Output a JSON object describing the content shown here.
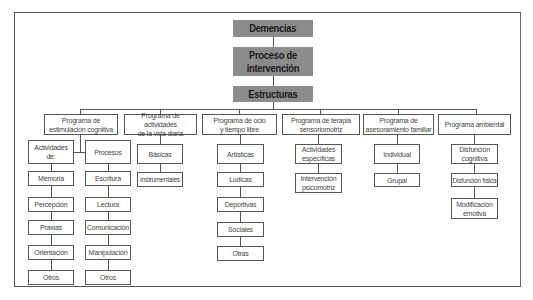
{
  "diagram": {
    "root": "Demencias",
    "level2": "Proceso de\nintervención",
    "level3": "Estructuras",
    "colors": {
      "header_fill": "#8c8c8c",
      "border": "#555555",
      "text": "#444444"
    },
    "programs": [
      {
        "label": "Programa de\nestimulación cognitiva",
        "groups": [
          {
            "label": "Actividades\nde:",
            "items": [
              "Memoria",
              "Percepción",
              "Praxias",
              "Orientación",
              "Otros"
            ]
          },
          {
            "label": "Procesos",
            "items": [
              "Escritura",
              "Lectura",
              "Comunicación",
              "Manipulación",
              "Otros"
            ]
          }
        ]
      },
      {
        "label": "Programa de actividades\nde la vida diaria",
        "items": [
          "Básicas",
          "Instrumentales"
        ]
      },
      {
        "label": "Programa de ocio\ny tiempo libre",
        "items": [
          "Artísticas",
          "Lúdicas",
          "Deportivas",
          "Sociales",
          "Otras"
        ]
      },
      {
        "label": "Programa de terapia\nsensoriomotriz",
        "items": [
          "Actividades\nespecíficas",
          "Intervención\npsicomotriz"
        ]
      },
      {
        "label": "Programa de\nasesoramiento familiar",
        "items": [
          "Individual",
          "Grupal"
        ]
      },
      {
        "label": "Programa ambiental",
        "items": [
          "Disfunción\ncognitiva",
          "Disfunción física",
          "Modificación\nemotiva"
        ]
      }
    ]
  }
}
